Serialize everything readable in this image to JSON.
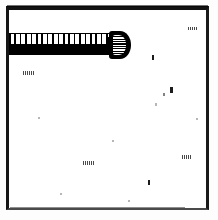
{
  "figure": {
    "title": "",
    "caption": "",
    "medium": "scanned line drawing",
    "background_color": "#ffffff",
    "ink_color": "#000000",
    "canvas": {
      "width": 218,
      "height": 220
    }
  },
  "frame": {
    "name": "figure border rectangle",
    "color": "#111111",
    "top_rule_weight": 4,
    "side_rule_weight": 3,
    "bottom_rule_weight": 2,
    "bottom_rule_color": "#4a4a4a"
  },
  "object": {
    "name": "screw",
    "label": "",
    "orientation": "horizontal",
    "parts": [
      {
        "name": "threaded shaft",
        "label": ""
      },
      {
        "name": "knurled head",
        "label": ""
      }
    ],
    "thread_count": 20,
    "color": "#000000"
  },
  "artifacts": {
    "name": "scan speckles",
    "count": 14,
    "color": "#1c1c1c",
    "marks": [
      {
        "id": "mark-1",
        "text": ""
      },
      {
        "id": "mark-2",
        "text": ""
      },
      {
        "id": "mark-3",
        "text": ""
      },
      {
        "id": "mark-4",
        "text": ""
      },
      {
        "id": "mark-5",
        "text": ""
      }
    ]
  }
}
